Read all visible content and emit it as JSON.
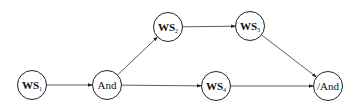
{
  "diagram": {
    "type": "workflow",
    "nodes": [
      {
        "id": "ws1",
        "label": "WS",
        "sub": "1",
        "cx": 32,
        "cy": 85
      },
      {
        "id": "and",
        "label": "And",
        "sub": "",
        "cx": 107,
        "cy": 85
      },
      {
        "id": "ws2",
        "label": "WS",
        "sub": "2",
        "cx": 168,
        "cy": 27
      },
      {
        "id": "ws3",
        "label": "WS",
        "sub": "3",
        "cx": 250,
        "cy": 26
      },
      {
        "id": "ws4",
        "label": "WS",
        "sub": "4",
        "cx": 216,
        "cy": 86
      },
      {
        "id": "endand",
        "label": "/And",
        "sub": "",
        "cx": 328,
        "cy": 86
      }
    ],
    "edges": [
      {
        "from": "ws1",
        "to": "and"
      },
      {
        "from": "and",
        "to": "ws2"
      },
      {
        "from": "ws2",
        "to": "ws3"
      },
      {
        "from": "and",
        "to": "ws4"
      },
      {
        "from": "ws3",
        "to": "endand"
      },
      {
        "from": "ws4",
        "to": "endand"
      }
    ]
  }
}
